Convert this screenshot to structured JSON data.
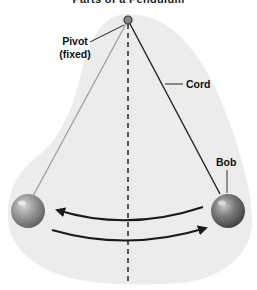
{
  "diagram": {
    "title": "Parts of a Pendulum",
    "labels": {
      "pivot": "Pivot",
      "pivot_note": "(fixed)",
      "cord": "Cord",
      "bob": "Bob"
    },
    "components": [
      "pivot",
      "cord",
      "bob",
      "center-line",
      "swing-arrows"
    ],
    "colors": {
      "background_blob": "#ececec",
      "bob": "#8a8a8a",
      "cord_left": "#9a9a9a",
      "cord_right": "#222222",
      "dashed_line": "#555555",
      "arrows": "#1a1a1a"
    }
  }
}
